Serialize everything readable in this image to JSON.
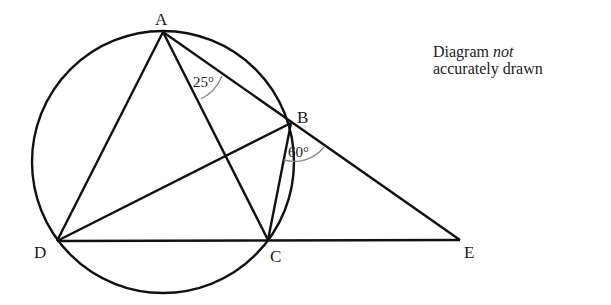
{
  "diagram": {
    "type": "circle-geometry",
    "points": {
      "A": {
        "label": "A",
        "x": 163,
        "y": 32
      },
      "B": {
        "label": "B",
        "x": 291,
        "y": 123
      },
      "C": {
        "label": "C",
        "x": 268,
        "y": 240
      },
      "D": {
        "label": "D",
        "x": 57,
        "y": 241
      },
      "E": {
        "label": "E",
        "x": 460,
        "y": 240
      }
    },
    "circle": {
      "cx": 163,
      "cy": 162,
      "r": 131
    },
    "segments": [
      "AD",
      "AC",
      "AB",
      "BE",
      "BD",
      "BC",
      "DE"
    ],
    "angles": [
      {
        "at": "A",
        "between": "CAB",
        "label": "25°"
      },
      {
        "at": "B",
        "between": "CBE",
        "label": "60°"
      }
    ],
    "note": {
      "line1_prefix": "Diagram ",
      "line1_emphasis": "not",
      "line2": "accurately drawn"
    }
  }
}
